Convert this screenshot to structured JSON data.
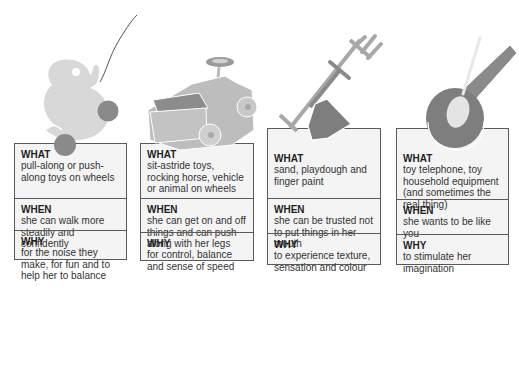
{
  "colors": {
    "light": "#d8d8d8",
    "mid": "#a9a9a9",
    "dark": "#7a7a7a",
    "card_bg": "#f4f4f4",
    "border": "#5a5a5a"
  },
  "columns": [
    {
      "illustration": "pull-along duck toy",
      "what_label": "WHAT",
      "what_text": "pull-along or push-along toys on wheels",
      "when_label": "WHEN",
      "when_text": "she can walk more steadily and confidently",
      "why_label": "WHY",
      "why_text": "for the noise they make, for fun and to help her to balance"
    },
    {
      "illustration": "sit-astride ride-on car",
      "what_label": "WHAT",
      "what_text": "sit-astride toys, rocking horse, vehicle or animal on wheels",
      "when_label": "WHEN",
      "when_text": "she can get on and off things and can push along with her legs",
      "why_label": "WHY",
      "why_text": "for control, balance and sense of speed"
    },
    {
      "illustration": "fork and spade",
      "what_label": "WHAT",
      "what_text": "sand, playdough and finger paint",
      "when_label": "WHEN",
      "when_text": "she can be trusted not to put things in her mouth",
      "why_label": "WHY",
      "why_text": "to experience texture, sensation and colour"
    },
    {
      "illustration": "toy pan and spoon",
      "what_label": "WHAT",
      "what_text": "toy telephone, toy household equipment (and sometimes the real thing)",
      "when_label": "WHEN",
      "when_text": "she wants to be like you",
      "why_label": "WHY",
      "why_text": "to stimulate her imagination"
    }
  ]
}
